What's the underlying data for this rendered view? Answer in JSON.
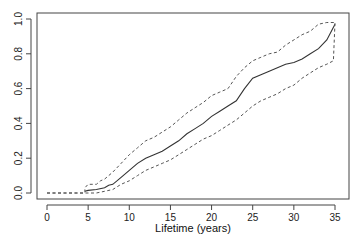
{
  "chart_data": {
    "type": "line",
    "title": "",
    "xlabel": "Lifetime (years)",
    "ylabel": "",
    "xlim": [
      0,
      35
    ],
    "ylim": [
      0.0,
      1.0
    ],
    "x_ticks": [
      0,
      5,
      10,
      15,
      20,
      25,
      30,
      35
    ],
    "x_tick_labels": [
      "0",
      "5",
      "10",
      "15",
      "20",
      "25",
      "30",
      "35"
    ],
    "y_ticks": [
      0.0,
      0.2,
      0.4,
      0.6,
      0.8,
      1.0
    ],
    "y_tick_labels": [
      "0.0",
      "0.2",
      "0.4",
      "0.6",
      "0.8",
      "1.0"
    ],
    "grid": false,
    "legend": null,
    "series": [
      {
        "name": "estimate",
        "style": "solid",
        "x": [
          0,
          4.6,
          5,
          6,
          7,
          7.5,
          8,
          9,
          10,
          11,
          12,
          13,
          14,
          15,
          16,
          17,
          18,
          19,
          20,
          21,
          22,
          23,
          24,
          25,
          26,
          27,
          28,
          29,
          30,
          31,
          32,
          33,
          34,
          35
        ],
        "values": [
          null,
          0.01,
          0.015,
          0.02,
          0.03,
          0.045,
          0.05,
          0.09,
          0.13,
          0.17,
          0.2,
          0.22,
          0.24,
          0.27,
          0.3,
          0.34,
          0.37,
          0.4,
          0.44,
          0.47,
          0.5,
          0.53,
          0.6,
          0.66,
          0.68,
          0.7,
          0.72,
          0.74,
          0.75,
          0.77,
          0.8,
          0.83,
          0.88,
          0.97
        ]
      },
      {
        "name": "upper bound",
        "style": "dashed",
        "x": [
          0,
          4.6,
          4.6,
          5,
          6,
          6.5,
          7,
          8,
          9,
          10,
          11,
          12,
          13,
          14,
          15,
          16,
          17,
          18,
          19,
          20,
          21,
          22,
          23,
          24,
          25,
          26,
          27,
          28,
          29,
          30,
          31,
          32,
          33,
          34,
          35
        ],
        "values": [
          0.0,
          0.0,
          0.03,
          0.05,
          0.05,
          0.07,
          0.08,
          0.12,
          0.17,
          0.22,
          0.26,
          0.3,
          0.32,
          0.35,
          0.38,
          0.42,
          0.46,
          0.49,
          0.52,
          0.56,
          0.58,
          0.6,
          0.67,
          0.72,
          0.76,
          0.78,
          0.8,
          0.81,
          0.85,
          0.88,
          0.91,
          0.93,
          0.97,
          0.98,
          0.98
        ]
      },
      {
        "name": "lower bound",
        "style": "dashed",
        "x": [
          0,
          5,
          6,
          7,
          8,
          9,
          10,
          11,
          12,
          13,
          14,
          15,
          16,
          17,
          18,
          19,
          20,
          21,
          22,
          23,
          24,
          25,
          26,
          27,
          28,
          29,
          30,
          31,
          32,
          33,
          34,
          34.8,
          35
        ],
        "values": [
          0.0,
          0.0,
          0.0,
          0.01,
          0.02,
          0.05,
          0.07,
          0.1,
          0.13,
          0.15,
          0.17,
          0.19,
          0.22,
          0.25,
          0.28,
          0.31,
          0.33,
          0.36,
          0.39,
          0.42,
          0.46,
          0.5,
          0.53,
          0.55,
          0.57,
          0.6,
          0.62,
          0.66,
          0.69,
          0.72,
          0.74,
          0.76,
          0.98
        ]
      }
    ]
  }
}
